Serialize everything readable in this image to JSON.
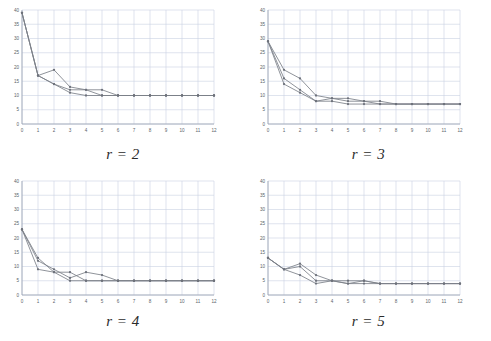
{
  "figure": {
    "layout": "2x2-grid",
    "panel_count": 4,
    "line_color": "#7b7f88",
    "marker_color": "#6e727b",
    "grid_color": "#c9d2e3",
    "axis_color": "#9aa3b2",
    "background": "#ffffff"
  },
  "chart_data": [
    {
      "type": "line",
      "title": "r = 2",
      "xlabel": "",
      "ylabel": "",
      "xlim": [
        0,
        12
      ],
      "ylim": [
        0,
        40
      ],
      "xticks": [
        0,
        1,
        2,
        3,
        4,
        5,
        6,
        7,
        8,
        9,
        10,
        11,
        12
      ],
      "yticks": [
        0,
        5,
        10,
        15,
        20,
        25,
        30,
        35,
        40
      ],
      "grid": true,
      "legend": "none",
      "x": [
        0,
        1,
        2,
        3,
        4,
        5,
        6,
        7,
        8,
        9,
        10,
        11,
        12
      ],
      "series": [
        {
          "name": "run-1",
          "values": [
            39,
            17,
            19,
            13,
            12,
            12,
            10,
            10,
            10,
            10,
            10,
            10,
            10
          ]
        },
        {
          "name": "run-2",
          "values": [
            39,
            17,
            14,
            12,
            12,
            10,
            10,
            10,
            10,
            10,
            10,
            10,
            10
          ]
        },
        {
          "name": "run-3",
          "values": [
            39,
            17,
            14,
            11,
            10,
            10,
            10,
            10,
            10,
            10,
            10,
            10,
            10
          ]
        }
      ]
    },
    {
      "type": "line",
      "title": "r = 3",
      "xlabel": "",
      "ylabel": "",
      "xlim": [
        0,
        12
      ],
      "ylim": [
        0,
        40
      ],
      "xticks": [
        0,
        1,
        2,
        3,
        4,
        5,
        6,
        7,
        8,
        9,
        10,
        11,
        12
      ],
      "yticks": [
        0,
        5,
        10,
        15,
        20,
        25,
        30,
        35,
        40
      ],
      "grid": true,
      "legend": "none",
      "x": [
        0,
        1,
        2,
        3,
        4,
        5,
        6,
        7,
        8,
        9,
        10,
        11,
        12
      ],
      "series": [
        {
          "name": "run-1",
          "values": [
            29,
            19,
            16,
            10,
            9,
            9,
            8,
            8,
            7,
            7,
            7,
            7,
            7
          ]
        },
        {
          "name": "run-2",
          "values": [
            29,
            16,
            12,
            8,
            9,
            8,
            8,
            7,
            7,
            7,
            7,
            7,
            7
          ]
        },
        {
          "name": "run-3",
          "values": [
            29,
            14,
            11,
            8,
            8,
            7,
            7,
            7,
            7,
            7,
            7,
            7,
            7
          ]
        }
      ]
    },
    {
      "type": "line",
      "title": "r = 4",
      "xlabel": "",
      "ylabel": "",
      "xlim": [
        0,
        12
      ],
      "ylim": [
        0,
        40
      ],
      "xticks": [
        0,
        1,
        2,
        3,
        4,
        5,
        6,
        7,
        8,
        9,
        10,
        11,
        12
      ],
      "yticks": [
        0,
        5,
        10,
        15,
        20,
        25,
        30,
        35,
        40
      ],
      "grid": true,
      "legend": "none",
      "x": [
        0,
        1,
        2,
        3,
        4,
        5,
        6,
        7,
        8,
        9,
        10,
        11,
        12
      ],
      "series": [
        {
          "name": "run-1",
          "values": [
            23,
            12,
            9,
            6,
            8,
            7,
            5,
            5,
            5,
            5,
            5,
            5,
            5
          ]
        },
        {
          "name": "run-2",
          "values": [
            23,
            13,
            8,
            8,
            5,
            5,
            5,
            5,
            5,
            5,
            5,
            5,
            5
          ]
        },
        {
          "name": "run-3",
          "values": [
            23,
            9,
            8,
            5,
            5,
            5,
            5,
            5,
            5,
            5,
            5,
            5,
            5
          ]
        }
      ]
    },
    {
      "type": "line",
      "title": "r = 5",
      "xlabel": "",
      "ylabel": "",
      "xlim": [
        0,
        12
      ],
      "ylim": [
        0,
        40
      ],
      "xticks": [
        0,
        1,
        2,
        3,
        4,
        5,
        6,
        7,
        8,
        9,
        10,
        11,
        12
      ],
      "yticks": [
        0,
        5,
        10,
        15,
        20,
        25,
        30,
        35,
        40
      ],
      "grid": true,
      "legend": "none",
      "x": [
        0,
        1,
        2,
        3,
        4,
        5,
        6,
        7,
        8,
        9,
        10,
        11,
        12
      ],
      "series": [
        {
          "name": "run-1",
          "values": [
            13,
            9,
            11,
            7,
            5,
            5,
            5,
            4,
            4,
            4,
            4,
            4,
            4
          ]
        },
        {
          "name": "run-2",
          "values": [
            13,
            9,
            10,
            5,
            5,
            4,
            5,
            4,
            4,
            4,
            4,
            4,
            4
          ]
        },
        {
          "name": "run-3",
          "values": [
            13,
            9,
            7,
            4,
            5,
            4,
            4,
            4,
            4,
            4,
            4,
            4,
            4
          ]
        }
      ]
    }
  ]
}
